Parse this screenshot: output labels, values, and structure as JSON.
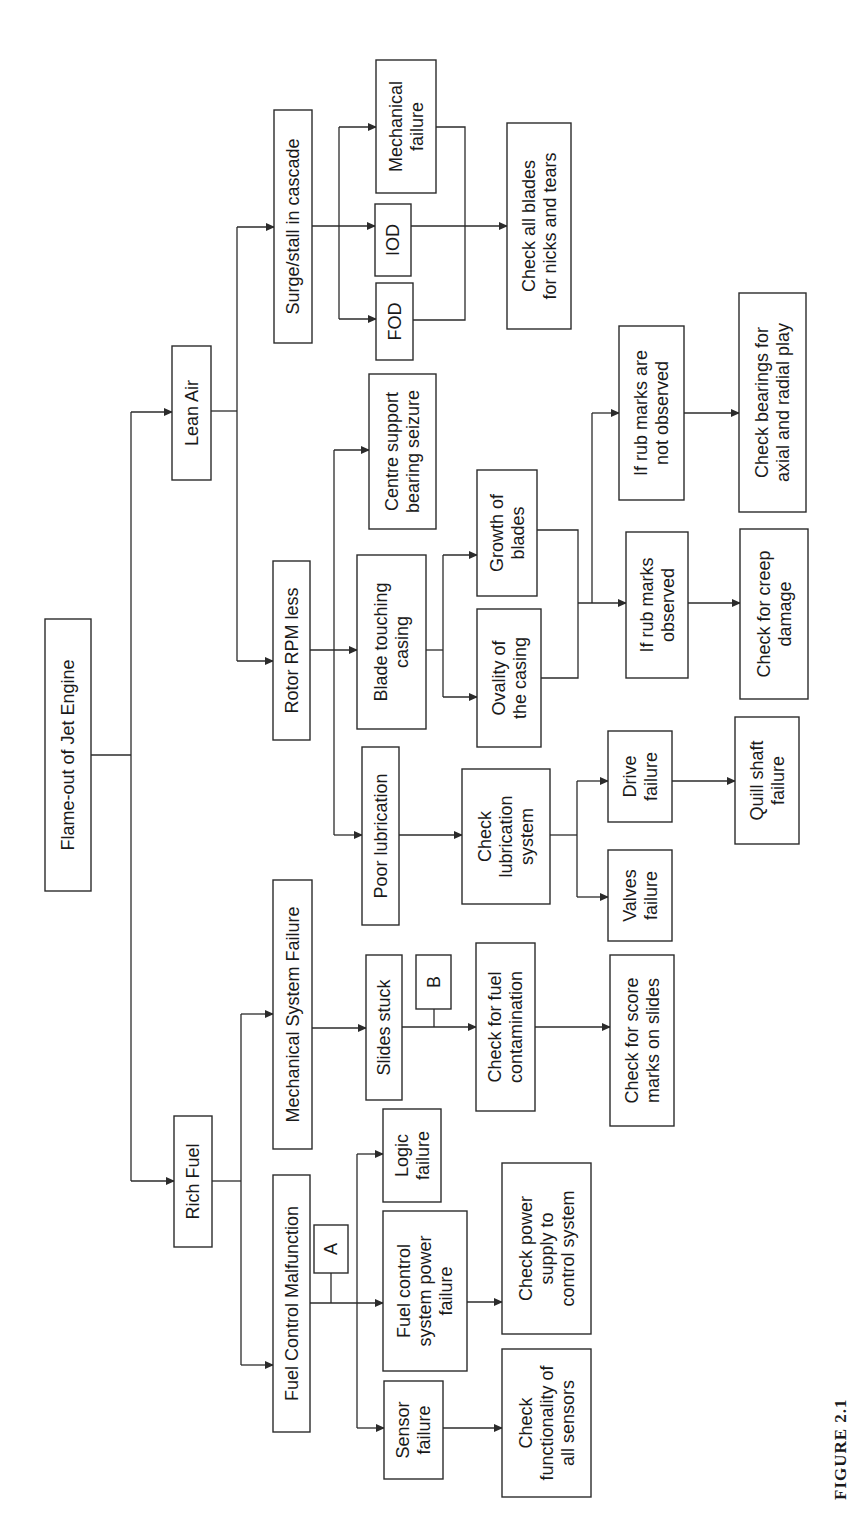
{
  "figure": {
    "caption": "FIGURE 2.1"
  },
  "diagram": {
    "title": "Flame-out of Jet Engine",
    "orientation": "rotated-90-ccw",
    "line_color": "#2b2b2b",
    "nodes": [
      {
        "id": "root",
        "lines": [
          "Flame-out of Jet Engine"
        ],
        "x": 45,
        "y": 619,
        "w": 46,
        "h": 272
      },
      {
        "id": "lean_air",
        "lines": [
          "Lean Air"
        ],
        "x": 172,
        "y": 346,
        "w": 39,
        "h": 134
      },
      {
        "id": "rich_fuel",
        "lines": [
          "Rich Fuel"
        ],
        "x": 174,
        "y": 1116,
        "w": 38,
        "h": 131
      },
      {
        "id": "surge",
        "lines": [
          "Surge/stall in cascade"
        ],
        "x": 274,
        "y": 110,
        "w": 38,
        "h": 233
      },
      {
        "id": "rotor_rpm",
        "lines": [
          "Rotor RPM less"
        ],
        "x": 273,
        "y": 561,
        "w": 37,
        "h": 179
      },
      {
        "id": "mech_sys",
        "lines": [
          "Mechanical System Failure"
        ],
        "x": 273,
        "y": 880,
        "w": 39,
        "h": 269
      },
      {
        "id": "fuel_ctrl",
        "lines": [
          "Fuel Control Malfunction"
        ],
        "x": 273,
        "y": 1175,
        "w": 37,
        "h": 257
      },
      {
        "id": "mech_fail",
        "lines": [
          "Mechanical",
          "failure"
        ],
        "x": 376,
        "y": 60,
        "w": 60,
        "h": 133
      },
      {
        "id": "iod",
        "lines": [
          "IOD"
        ],
        "x": 375,
        "y": 204,
        "w": 36,
        "h": 72
      },
      {
        "id": "fod",
        "lines": [
          "FOD"
        ],
        "x": 376,
        "y": 283,
        "w": 37,
        "h": 77
      },
      {
        "id": "check_blades",
        "lines": [
          "Check all blades",
          "for nicks and tears"
        ],
        "x": 507,
        "y": 123,
        "w": 64,
        "h": 206
      },
      {
        "id": "centre_support",
        "lines": [
          "Centre support",
          "bearing seizure"
        ],
        "x": 369,
        "y": 374,
        "w": 67,
        "h": 155
      },
      {
        "id": "blade_touching",
        "lines": [
          "Blade touching",
          "casing"
        ],
        "x": 357,
        "y": 555,
        "w": 69,
        "h": 174
      },
      {
        "id": "growth",
        "lines": [
          "Growth of",
          "blades"
        ],
        "x": 477,
        "y": 470,
        "w": 60,
        "h": 126
      },
      {
        "id": "ovality",
        "lines": [
          "Ovality of",
          "the casing"
        ],
        "x": 477,
        "y": 609,
        "w": 64,
        "h": 138
      },
      {
        "id": "rub_not_observed",
        "lines": [
          "If rub marks are",
          "not observed"
        ],
        "x": 619,
        "y": 326,
        "w": 65,
        "h": 174
      },
      {
        "id": "rub_observed",
        "lines": [
          "If rub marks",
          "observed"
        ],
        "x": 626,
        "y": 532,
        "w": 62,
        "h": 146
      },
      {
        "id": "check_bearings",
        "lines": [
          "Check bearings for",
          "axial and radial play"
        ],
        "x": 739,
        "y": 293,
        "w": 67,
        "h": 219
      },
      {
        "id": "check_creep",
        "lines": [
          "Check for creep",
          "damage"
        ],
        "x": 740,
        "y": 529,
        "w": 68,
        "h": 170
      },
      {
        "id": "poor_lub",
        "lines": [
          "Poor lubrication"
        ],
        "x": 362,
        "y": 747,
        "w": 37,
        "h": 178
      },
      {
        "id": "check_lub",
        "lines": [
          "Check",
          "lubrication",
          "system"
        ],
        "x": 462,
        "y": 769,
        "w": 88,
        "h": 135
      },
      {
        "id": "drive_fail",
        "lines": [
          "Drive",
          "failure"
        ],
        "x": 608,
        "y": 731,
        "w": 64,
        "h": 91
      },
      {
        "id": "valves_fail",
        "lines": [
          "Valves",
          "failure"
        ],
        "x": 608,
        "y": 850,
        "w": 64,
        "h": 91
      },
      {
        "id": "quill_fail",
        "lines": [
          "Quill shaft",
          "failure"
        ],
        "x": 735,
        "y": 717,
        "w": 64,
        "h": 127
      },
      {
        "id": "slides_stuck",
        "lines": [
          "Slides stuck"
        ],
        "x": 366,
        "y": 955,
        "w": 36,
        "h": 145
      },
      {
        "id": "label_b",
        "lines": [
          "B"
        ],
        "x": 416,
        "y": 955,
        "w": 35,
        "h": 54
      },
      {
        "id": "check_contam",
        "lines": [
          "Check for fuel",
          "contamination"
        ],
        "x": 476,
        "y": 943,
        "w": 59,
        "h": 168
      },
      {
        "id": "check_score",
        "lines": [
          "Check for score",
          "marks on slides"
        ],
        "x": 610,
        "y": 955,
        "w": 64,
        "h": 171
      },
      {
        "id": "logic_fail",
        "lines": [
          "Logic",
          "failure"
        ],
        "x": 383,
        "y": 1109,
        "w": 58,
        "h": 93
      },
      {
        "id": "label_a",
        "lines": [
          "A"
        ],
        "x": 314,
        "y": 1225,
        "w": 34,
        "h": 48
      },
      {
        "id": "fc_power_fail",
        "lines": [
          "Fuel control",
          "system power",
          "failure"
        ],
        "x": 383,
        "y": 1211,
        "w": 84,
        "h": 160
      },
      {
        "id": "sensor_fail",
        "lines": [
          "Sensor",
          "failure"
        ],
        "x": 384,
        "y": 1381,
        "w": 59,
        "h": 98
      },
      {
        "id": "check_power",
        "lines": [
          "Check power",
          "supply to",
          "control system"
        ],
        "x": 502,
        "y": 1163,
        "w": 89,
        "h": 171
      },
      {
        "id": "check_sensors",
        "lines": [
          "Check",
          "functionality of",
          "all sensors"
        ],
        "x": 502,
        "y": 1349,
        "w": 89,
        "h": 148
      }
    ],
    "edges": [
      {
        "path": "M91,755 L131,755",
        "arrow": false
      },
      {
        "path": "M131,412 L131,1181",
        "arrow": false
      },
      {
        "path": "M131,412 L172,412",
        "arrow": true
      },
      {
        "path": "M131,1181 L174,1181",
        "arrow": true
      },
      {
        "path": "M211,411 L237,411",
        "arrow": false
      },
      {
        "path": "M237,227 L237,661",
        "arrow": false
      },
      {
        "path": "M237,227 L274,227",
        "arrow": true
      },
      {
        "path": "M237,661 L273,661",
        "arrow": true
      },
      {
        "path": "M212,1181 L241,1181",
        "arrow": false
      },
      {
        "path": "M241,1014 L241,1365",
        "arrow": false
      },
      {
        "path": "M241,1014 L273,1014",
        "arrow": true
      },
      {
        "path": "M241,1365 L273,1365",
        "arrow": true
      },
      {
        "path": "M312,226 L375,226",
        "arrow": true
      },
      {
        "path": "M339,127 L339,319",
        "arrow": false
      },
      {
        "path": "M339,127 L376,127",
        "arrow": true
      },
      {
        "path": "M339,319 L376,319",
        "arrow": true
      },
      {
        "path": "M436,127 L465,127 L465,320 L413,320",
        "arrow": false
      },
      {
        "path": "M411,226 L507,226",
        "arrow": true
      },
      {
        "path": "M310,650 L357,650",
        "arrow": true
      },
      {
        "path": "M334,450 L334,835",
        "arrow": false
      },
      {
        "path": "M334,450 L369,450",
        "arrow": true
      },
      {
        "path": "M334,835 L362,835",
        "arrow": true
      },
      {
        "path": "M426,650 L443,650",
        "arrow": false
      },
      {
        "path": "M443,555 L443,697",
        "arrow": false
      },
      {
        "path": "M443,555 L477,555",
        "arrow": true
      },
      {
        "path": "M443,697 L477,697",
        "arrow": true
      },
      {
        "path": "M537,530 L578,530 L578,678 L541,678",
        "arrow": false
      },
      {
        "path": "M578,603 L626,603",
        "arrow": true
      },
      {
        "path": "M592,603 L592,413",
        "arrow": false
      },
      {
        "path": "M592,413 L619,413",
        "arrow": true
      },
      {
        "path": "M688,603 L740,603",
        "arrow": true
      },
      {
        "path": "M684,413 L739,413",
        "arrow": true
      },
      {
        "path": "M399,835 L462,835",
        "arrow": true
      },
      {
        "path": "M550,835 L577,835",
        "arrow": false
      },
      {
        "path": "M577,781 L577,897",
        "arrow": false
      },
      {
        "path": "M577,781 L608,781",
        "arrow": true
      },
      {
        "path": "M577,897 L608,897",
        "arrow": true
      },
      {
        "path": "M672,781 L735,781",
        "arrow": true
      },
      {
        "path": "M312,1028 L366,1028",
        "arrow": true
      },
      {
        "path": "M402,1027 L476,1027",
        "arrow": true
      },
      {
        "path": "M434,1009 L434,1027",
        "arrow": false
      },
      {
        "path": "M535,1027 L610,1027",
        "arrow": true
      },
      {
        "path": "M310,1303 L383,1303",
        "arrow": true
      },
      {
        "path": "M331,1273 L331,1303",
        "arrow": false
      },
      {
        "path": "M357,1154 L357,1428",
        "arrow": false
      },
      {
        "path": "M357,1154 L383,1154",
        "arrow": true
      },
      {
        "path": "M357,1428 L384,1428",
        "arrow": true
      },
      {
        "path": "M467,1302 L502,1302",
        "arrow": true
      },
      {
        "path": "M443,1428 L502,1428",
        "arrow": true
      }
    ]
  }
}
